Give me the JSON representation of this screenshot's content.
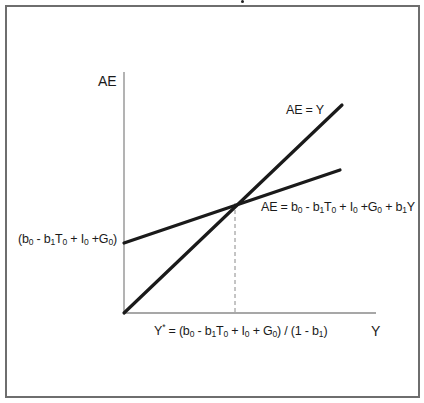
{
  "diagram": {
    "title": "",
    "y_axis_label": "AE",
    "x_axis_label": "Y",
    "line_45_label": "AE = Y",
    "ae_function_label": {
      "prefix": "AE = b",
      "parts": [
        "0",
        " - b",
        "1",
        "T",
        "0",
        " + I",
        "0",
        " +G",
        "0",
        " + b",
        "1",
        "Y"
      ]
    },
    "intercept_label": "(b0 - b1T0 + I0 +G0)",
    "equilibrium_label": "Y* = (b0 - b1T0 + I0 + G0) / (1 - b1)",
    "colors": {
      "lines": "#1a1a1a",
      "axes": "#8a8a8a",
      "frame": "#6e6e6e",
      "dashed": "#8a8a8a"
    },
    "geometry": {
      "origin": [
        124,
        313
      ],
      "y_axis_top": 72,
      "x_axis_right": 376,
      "line_45_end": [
        342,
        105
      ],
      "ae_start": [
        124,
        243
      ],
      "ae_end": [
        340,
        170
      ],
      "equilibrium": [
        235,
        203
      ]
    }
  }
}
